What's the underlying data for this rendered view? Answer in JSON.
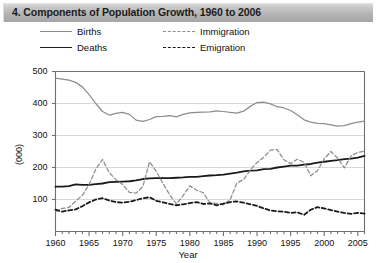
{
  "titlebar": {
    "title": "4. Components of Population Growth, 1960 to 2006"
  },
  "legend": {
    "births": "Births",
    "deaths": "Deaths",
    "immigration": "Immigration",
    "emigration": "Emigration"
  },
  "axes": {
    "ylabel": "(000)",
    "xlabel": "Year",
    "yticks": [
      "100",
      "200",
      "300",
      "400",
      "500"
    ],
    "xticks": [
      "1960",
      "1965",
      "1970",
      "1975",
      "1980",
      "1985",
      "1990",
      "1995",
      "2000",
      "2005"
    ]
  },
  "colors": {
    "births": "#8d8d8d",
    "deaths": "#1a1a1a",
    "immigration": "#8d8d8d",
    "emigration": "#1a1a1a",
    "grid": "#d9d9d9",
    "frame": "#6e6e6e",
    "titlebar_top": "#d8d8d8",
    "titlebar_bottom": "#a6a6a6"
  },
  "chart_data": {
    "type": "line",
    "title": "4. Components of Population Growth, 1960 to 2006",
    "xlabel": "Year",
    "ylabel": "(000)",
    "units": "thousands",
    "grid": true,
    "legend_position": "top",
    "xlim": [
      1960,
      2006
    ],
    "ylim": [
      0,
      500
    ],
    "ytick_values": [
      100,
      200,
      300,
      400,
      500
    ],
    "xtick_values": [
      1960,
      1965,
      1970,
      1975,
      1980,
      1985,
      1990,
      1995,
      2000,
      2005
    ],
    "minor_xticks": "every 1 year",
    "x": [
      1960,
      1961,
      1962,
      1963,
      1964,
      1965,
      1966,
      1967,
      1968,
      1969,
      1970,
      1971,
      1972,
      1973,
      1974,
      1975,
      1976,
      1977,
      1978,
      1979,
      1980,
      1981,
      1982,
      1983,
      1984,
      1985,
      1986,
      1987,
      1988,
      1989,
      1990,
      1991,
      1992,
      1993,
      1994,
      1995,
      1996,
      1997,
      1998,
      1999,
      2000,
      2001,
      2002,
      2003,
      2004,
      2005,
      2006
    ],
    "series": [
      {
        "name": "Births",
        "style": "solid",
        "color": "#8d8d8d",
        "values": [
          479,
          476,
          473,
          466,
          452,
          428,
          400,
          375,
          364,
          369,
          372,
          366,
          348,
          344,
          350,
          359,
          360,
          362,
          358,
          366,
          371,
          372,
          373,
          374,
          377,
          375,
          372,
          370,
          376,
          391,
          403,
          404,
          399,
          390,
          386,
          378,
          365,
          349,
          342,
          338,
          337,
          333,
          329,
          331,
          337,
          342,
          345
        ]
      },
      {
        "name": "Deaths",
        "style": "solid",
        "color": "#1a1a1a",
        "values": [
          140,
          140,
          142,
          147,
          146,
          146,
          148,
          150,
          154,
          155,
          156,
          157,
          160,
          164,
          166,
          167,
          167,
          167,
          168,
          169,
          171,
          171,
          173,
          175,
          176,
          178,
          181,
          184,
          188,
          190,
          191,
          195,
          196,
          200,
          203,
          206,
          206,
          209,
          211,
          215,
          218,
          221,
          223,
          226,
          228,
          231,
          236
        ]
      },
      {
        "name": "Immigration",
        "style": "dashed",
        "color": "#8d8d8d",
        "values": [
          62,
          72,
          75,
          95,
          113,
          147,
          195,
          225,
          184,
          162,
          147,
          122,
          120,
          140,
          218,
          188,
          150,
          115,
          86,
          112,
          143,
          129,
          121,
          89,
          88,
          84,
          99,
          152,
          162,
          192,
          216,
          232,
          254,
          256,
          224,
          212,
          226,
          216,
          174,
          190,
          227,
          250,
          229,
          199,
          236,
          247,
          251
        ]
      },
      {
        "name": "Emigration",
        "style": "dashed",
        "color": "#1a1a1a",
        "values": [
          68,
          62,
          66,
          69,
          79,
          91,
          100,
          104,
          97,
          92,
          90,
          93,
          98,
          104,
          107,
          96,
          91,
          86,
          82,
          85,
          89,
          92,
          86,
          88,
          82,
          87,
          92,
          94,
          90,
          85,
          80,
          72,
          66,
          63,
          62,
          58,
          60,
          52,
          68,
          76,
          72,
          67,
          62,
          58,
          55,
          58,
          56
        ]
      }
    ]
  }
}
